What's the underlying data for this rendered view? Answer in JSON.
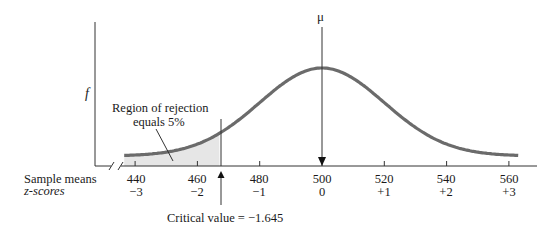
{
  "chart_data": {
    "type": "area",
    "title": "",
    "xlabel": "Sample means",
    "x2label": "z-scores",
    "ylabel": "f",
    "mean_label": "μ",
    "mean": 500,
    "standard_error": 20,
    "x_ticks": [
      440,
      460,
      480,
      500,
      520,
      540,
      560
    ],
    "z_ticks": [
      "−3",
      "−2",
      "−1",
      "0",
      "+1",
      "+2",
      "+3"
    ],
    "critical_value_z": -1.645,
    "critical_value_x": 467.1,
    "rejection_region": {
      "tail": "lower",
      "area_percent": 5
    },
    "annotations": [
      "Region of rejection equals 5%",
      "Critical value = −1.645"
    ],
    "xlim": [
      430,
      570
    ],
    "grid": false,
    "axis_break": true
  },
  "labels": {
    "y_axis": "f",
    "mu": "μ",
    "sample_means": "Sample means",
    "z_scores": "z-scores",
    "region_line1": "Region of rejection",
    "region_line2": "equals 5%",
    "critical": "Critical value = −1.645"
  },
  "ticks": [
    {
      "x": "440",
      "z": "−3"
    },
    {
      "x": "460",
      "z": "−2"
    },
    {
      "x": "480",
      "z": "−1"
    },
    {
      "x": "500",
      "z": "0"
    },
    {
      "x": "520",
      "z": "+1"
    },
    {
      "x": "540",
      "z": "+2"
    },
    {
      "x": "560",
      "z": "+3"
    }
  ],
  "colors": {
    "curve": "#6b6b6b",
    "shade": "#e6e6e6",
    "axis": "#333333"
  }
}
